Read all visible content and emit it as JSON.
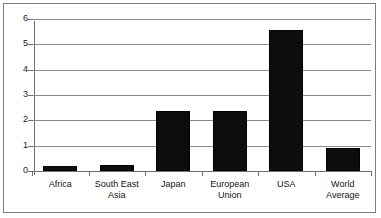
{
  "chart_data": {
    "type": "bar",
    "title": "",
    "subtitle": "",
    "xlabel": "",
    "ylabel": "",
    "ylim": [
      0,
      6
    ],
    "yticks": [
      "0",
      "1",
      "2",
      "3",
      "4",
      "5",
      "6"
    ],
    "grid": true,
    "legend": false,
    "legend_position": "none",
    "bar_color": "#0d0d0d",
    "categories": [
      "Africa",
      "South East\nAsia",
      "Japan",
      "European\nUnion",
      "USA",
      "World\nAverage"
    ],
    "values": [
      0.18,
      0.25,
      2.35,
      2.35,
      5.55,
      0.9
    ],
    "series": [
      {
        "name": "",
        "values": [
          0.18,
          0.25,
          2.35,
          2.35,
          5.55,
          0.9
        ]
      }
    ]
  },
  "axes": {
    "y_tick_labels": [
      "6",
      "5",
      "4",
      "3",
      "2",
      "1",
      "0"
    ]
  },
  "colors": {
    "frame": "#7d7d7d",
    "gridline": "#8a8a8a",
    "axis": "#6f6f6f",
    "bar": "#0d0d0d",
    "text": "#151515",
    "background": "#ffffff"
  }
}
